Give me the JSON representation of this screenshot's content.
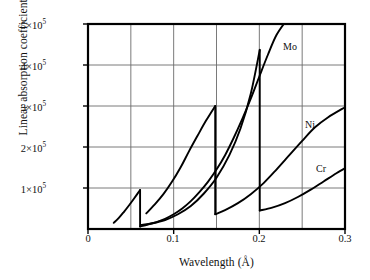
{
  "chart_data": {
    "type": "line",
    "title": "",
    "xlabel": "Wavelength (Å)",
    "ylabel": "Linear absorption coefficient (m⁻¹)",
    "xlim": [
      0,
      0.3
    ],
    "ylim": [
      0,
      500000
    ],
    "xticks": [
      "0",
      "0.1",
      "0.2",
      "0.3"
    ],
    "xtick_values": [
      0,
      0.1,
      0.2,
      0.3
    ],
    "yticks": [
      "1×10⁵",
      "2×10⁵",
      "3×10⁵",
      "4×10⁵",
      "5×10⁵"
    ],
    "ytick_values": [
      100000,
      200000,
      300000,
      400000,
      500000
    ],
    "grid": true,
    "gridlines_x": [
      0.05,
      0.1,
      0.15,
      0.2,
      0.25
    ],
    "gridlines_y": [
      100000,
      200000,
      300000,
      400000
    ],
    "legend_position": "inline-end-of-curve",
    "annotations": [
      {
        "text": "Mo",
        "x": 0.238,
        "y": 437000
      },
      {
        "text": "Ni",
        "x": 0.272,
        "y": 252000
      },
      {
        "text": "Cr",
        "x": 0.282,
        "y": 145000
      }
    ],
    "series": [
      {
        "name": "Mo",
        "label": "Mo",
        "absorption_edge_x": 0.0608,
        "segments": [
          {
            "from_x": 0.03,
            "to_x": 0.0608,
            "points": [
              [
                0.03,
                15000
              ],
              [
                0.036,
                27000
              ],
              [
                0.042,
                42000
              ],
              [
                0.048,
                58000
              ],
              [
                0.054,
                75000
              ],
              [
                0.0608,
                95000
              ]
            ]
          },
          {
            "from_x": 0.0608,
            "to_x": 0.232,
            "points": [
              [
                0.0608,
                6000
              ],
              [
                0.07,
                11000
              ],
              [
                0.08,
                17000
              ],
              [
                0.09,
                25000
              ],
              [
                0.1,
                36000
              ],
              [
                0.11,
                50000
              ],
              [
                0.12,
                68000
              ],
              [
                0.13,
                90000
              ],
              [
                0.14,
                115000
              ],
              [
                0.15,
                145000
              ],
              [
                0.16,
                180000
              ],
              [
                0.17,
                222000
              ],
              [
                0.18,
                268000
              ],
              [
                0.19,
                318000
              ],
              [
                0.2,
                372000
              ],
              [
                0.21,
                425000
              ],
              [
                0.22,
                473000
              ],
              [
                0.232,
                510000
              ]
            ]
          }
        ]
      },
      {
        "name": "Ni",
        "label": "Ni",
        "absorption_edge_x": 0.1485,
        "segments": [
          {
            "from_x": 0.068,
            "to_x": 0.1485,
            "points": [
              [
                0.068,
                38000
              ],
              [
                0.078,
                60000
              ],
              [
                0.088,
                85000
              ],
              [
                0.098,
                115000
              ],
              [
                0.108,
                150000
              ],
              [
                0.118,
                190000
              ],
              [
                0.128,
                228000
              ],
              [
                0.138,
                265000
              ],
              [
                0.1485,
                300000
              ]
            ]
          },
          {
            "from_x": 0.1485,
            "to_x": 0.3,
            "points": [
              [
                0.1485,
                36000
              ],
              [
                0.16,
                46000
              ],
              [
                0.175,
                63000
              ],
              [
                0.19,
                85000
              ],
              [
                0.205,
                112000
              ],
              [
                0.22,
                145000
              ],
              [
                0.235,
                180000
              ],
              [
                0.25,
                215000
              ],
              [
                0.265,
                248000
              ],
              [
                0.28,
                272000
              ],
              [
                0.3,
                297000
              ]
            ]
          }
        ]
      },
      {
        "name": "Cr",
        "label": "Cr",
        "absorption_edge_x": 0.2005,
        "segments": [
          {
            "from_x": 0.062,
            "to_x": 0.2005,
            "points": [
              [
                0.062,
                10000
              ],
              [
                0.075,
                14000
              ],
              [
                0.09,
                22000
              ],
              [
                0.105,
                36000
              ],
              [
                0.12,
                56000
              ],
              [
                0.135,
                86000
              ],
              [
                0.15,
                125000
              ],
              [
                0.165,
                180000
              ],
              [
                0.178,
                245000
              ],
              [
                0.19,
                330000
              ],
              [
                0.2005,
                437000
              ]
            ]
          },
          {
            "from_x": 0.2005,
            "to_x": 0.3,
            "points": [
              [
                0.2005,
                45000
              ],
              [
                0.215,
                52000
              ],
              [
                0.23,
                63000
              ],
              [
                0.245,
                78000
              ],
              [
                0.26,
                96000
              ],
              [
                0.275,
                116000
              ],
              [
                0.29,
                136000
              ],
              [
                0.3,
                148000
              ]
            ]
          }
        ]
      }
    ]
  },
  "axes": {
    "y_ticks": [
      {
        "label_base": "1×10",
        "label_exp": "5"
      },
      {
        "label_base": "2×10",
        "label_exp": "5"
      },
      {
        "label_base": "3×10",
        "label_exp": "5"
      },
      {
        "label_base": "4×10",
        "label_exp": "5"
      },
      {
        "label_base": "5×10",
        "label_exp": "5"
      }
    ],
    "x_ticks": [
      "0",
      "0.1",
      "0.2",
      "0.3"
    ],
    "x_axis_title": "Wavelength (Å)",
    "y_axis_title": "Linear absorption coefficient (m",
    "y_axis_title_exp": "−1",
    "y_axis_title_tail": ")"
  },
  "colors": {
    "curve": "#000000",
    "axis": "#000000",
    "grid": "#6b6b6b",
    "background": "#ffffff",
    "text": "#111111"
  }
}
